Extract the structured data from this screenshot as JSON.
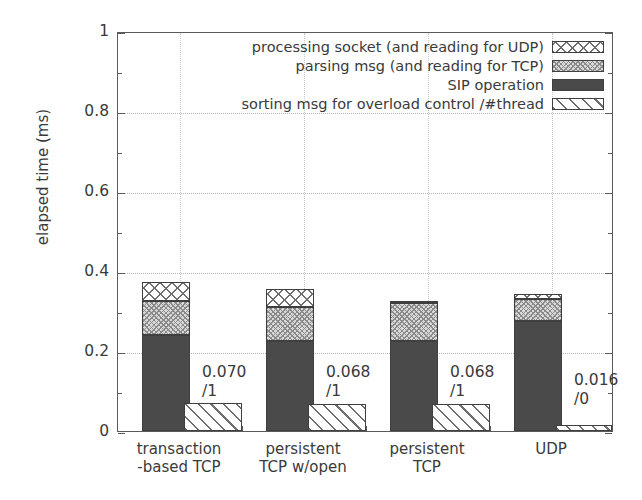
{
  "chart_data": {
    "type": "bar",
    "title": "",
    "subtitle": "",
    "xlabel": "",
    "ylabel": "elapsed time (ms)",
    "ylim": [
      0,
      1
    ],
    "ytick_labels": [
      "0",
      "0.2",
      "0.4",
      "0.6",
      "0.8",
      "1"
    ],
    "ytick_values": [
      0,
      0.2,
      0.4,
      0.6,
      0.8,
      1
    ],
    "yminor_values": [
      0.1,
      0.3,
      0.5,
      0.7,
      0.9
    ],
    "grid": "horizontal dotted at major y ticks; faint vertical dotted at category boundaries",
    "legend_position": "inside top-right, right-aligned labels with swatch at right",
    "stacked": true,
    "categories": [
      "transaction\n-based TCP",
      "persistent\nTCP w/open",
      "persistent\nTCP",
      "UDP"
    ],
    "series": [
      {
        "name": "SIP operation",
        "pattern": "solid-dark-gray",
        "color": "#4a4a4a",
        "values": [
          0.24,
          0.225,
          0.225,
          0.275
        ]
      },
      {
        "name": "parsing msg (and reading for TCP)",
        "pattern": "fine-stipple",
        "color": "#d8d8d8",
        "values": [
          0.085,
          0.085,
          0.095,
          0.055
        ]
      },
      {
        "name": "processing socket (and reading for UDP)",
        "pattern": "crosshatch",
        "color": "#ffffff",
        "values": [
          0.047,
          0.045,
          0.005,
          0.012
        ]
      }
    ],
    "stack_totals": [
      0.372,
      0.355,
      0.325,
      0.342
    ],
    "overlay_series": {
      "name": "sorting msg for overload control /#thread",
      "pattern": "diagonal-stripes",
      "color": "#ffffff",
      "note": "drawn as a separate narrow bar offset to the right of each stack, starting at y=0",
      "values": [
        0.07,
        0.068,
        0.068,
        0.016
      ]
    },
    "annotations": [
      {
        "text": "0.070\n/1",
        "category": "transaction-based TCP"
      },
      {
        "text": "0.068\n/1",
        "category": "persistent TCP w/open"
      },
      {
        "text": "0.068\n/1",
        "category": "persistent TCP"
      },
      {
        "text": "0.016\n/0",
        "category": "UDP"
      }
    ]
  },
  "legend": {
    "items": [
      {
        "label": "processing socket (and reading for UDP)",
        "swatch": "crosshatch"
      },
      {
        "label": "parsing msg (and reading for TCP)",
        "swatch": "stipple"
      },
      {
        "label": "SIP operation",
        "swatch": "solid"
      },
      {
        "label": "sorting msg for overload control /#thread",
        "swatch": "diagonal"
      }
    ]
  },
  "axis": {
    "y_title": "elapsed time (ms)"
  }
}
